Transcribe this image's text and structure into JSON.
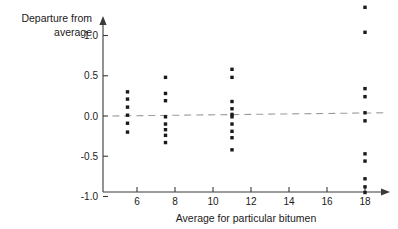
{
  "chart_data": {
    "type": "scatter",
    "title": "",
    "xlabel": "Average for particular bitumen",
    "ylabel_line1": "Departure from",
    "ylabel_line2": "average",
    "ylabel": "Departure from average",
    "xlim": [
      4.6,
      19.2
    ],
    "ylim": [
      -1.0,
      1.45
    ],
    "xticks": [
      6,
      8,
      10,
      12,
      14,
      16,
      18
    ],
    "xtick_labels": [
      "6",
      "8",
      "10",
      "12",
      "14",
      "16",
      "18"
    ],
    "yticks": [
      -1.0,
      -0.5,
      0.0,
      0.5,
      1.0
    ],
    "ytick_labels": [
      "-1.0",
      "-0.5",
      "0.0",
      "0.5",
      "1.0"
    ],
    "grid": false,
    "legend": "none",
    "reference_line": {
      "name": "zero-departure-dashed-line",
      "style": "dashed",
      "color": "#9a9a9a",
      "x_start": 4.7,
      "y_start": 0.0,
      "x_end": 19.0,
      "y_end": 0.04
    },
    "groups": [
      {
        "name": "bitumen-cluster-5-5",
        "x": 5.5,
        "y_values": [
          0.3,
          0.21,
          0.11,
          0.01,
          -0.09,
          -0.2
        ]
      },
      {
        "name": "bitumen-cluster-7-5",
        "x": 7.5,
        "y_values": [
          0.48,
          0.28,
          0.19,
          -0.01,
          -0.1,
          -0.17,
          -0.24,
          -0.33
        ]
      },
      {
        "name": "bitumen-cluster-11",
        "x": 11.0,
        "y_values": [
          0.58,
          0.48,
          0.18,
          0.09,
          0.02,
          -0.01,
          -0.1,
          -0.19,
          -0.27,
          -0.42
        ]
      },
      {
        "name": "bitumen-cluster-18",
        "x": 18.0,
        "y_values": [
          1.35,
          1.04,
          0.34,
          0.24,
          0.04,
          -0.06,
          -0.47,
          -0.56,
          -0.78,
          -0.88,
          -0.95
        ]
      }
    ],
    "points": [
      {
        "x": 5.5,
        "y": 0.3
      },
      {
        "x": 5.5,
        "y": 0.21
      },
      {
        "x": 5.5,
        "y": 0.11
      },
      {
        "x": 5.5,
        "y": 0.01
      },
      {
        "x": 5.5,
        "y": -0.09
      },
      {
        "x": 5.5,
        "y": -0.2
      },
      {
        "x": 7.5,
        "y": 0.48
      },
      {
        "x": 7.5,
        "y": 0.28
      },
      {
        "x": 7.5,
        "y": 0.19
      },
      {
        "x": 7.5,
        "y": -0.01
      },
      {
        "x": 7.5,
        "y": -0.1
      },
      {
        "x": 7.5,
        "y": -0.17
      },
      {
        "x": 7.5,
        "y": -0.24
      },
      {
        "x": 7.5,
        "y": -0.33
      },
      {
        "x": 11.0,
        "y": 0.58
      },
      {
        "x": 11.0,
        "y": 0.48
      },
      {
        "x": 11.0,
        "y": 0.18
      },
      {
        "x": 11.0,
        "y": 0.09
      },
      {
        "x": 11.0,
        "y": 0.02
      },
      {
        "x": 11.0,
        "y": -0.01
      },
      {
        "x": 11.0,
        "y": -0.1
      },
      {
        "x": 11.0,
        "y": -0.19
      },
      {
        "x": 11.0,
        "y": -0.27
      },
      {
        "x": 11.0,
        "y": -0.42
      },
      {
        "x": 18.0,
        "y": 1.35
      },
      {
        "x": 18.0,
        "y": 1.04
      },
      {
        "x": 18.0,
        "y": 0.34
      },
      {
        "x": 18.0,
        "y": 0.24
      },
      {
        "x": 18.0,
        "y": 0.04
      },
      {
        "x": 18.0,
        "y": -0.06
      },
      {
        "x": 18.0,
        "y": -0.47
      },
      {
        "x": 18.0,
        "y": -0.56
      },
      {
        "x": 18.0,
        "y": -0.78
      },
      {
        "x": 18.0,
        "y": -0.88
      },
      {
        "x": 18.0,
        "y": -0.95
      }
    ],
    "colors": {
      "point": "#1a1a1a",
      "axis": "#3a3a3a",
      "reference_line": "#9a9a9a",
      "background": "#ffffff",
      "text": "#1a1a1a"
    }
  }
}
